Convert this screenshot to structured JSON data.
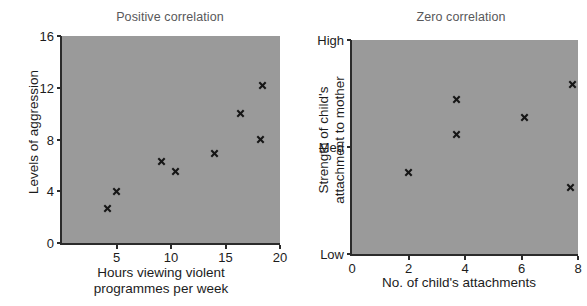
{
  "figure": {
    "background_color": "#ffffff",
    "plot_background_color": "#9a9a9a",
    "axis_color": "#2b2b2b",
    "title_color": "#58585a",
    "marker_color": "#161616",
    "marker_symbol": "x"
  },
  "chart_data": [
    {
      "type": "scatter",
      "title": "Positive correlation",
      "xlabel": "Hours viewing violent\nprogrammes per week",
      "ylabel": "Levels of aggression",
      "xlim": [
        0,
        20
      ],
      "ylim": [
        0,
        16
      ],
      "xticks": [
        5,
        10,
        15,
        20
      ],
      "xtick_labels": [
        "5",
        "10",
        "15",
        "20"
      ],
      "yticks": [
        0,
        4,
        8,
        12,
        16
      ],
      "ytick_labels": [
        "0",
        "4",
        "8",
        "12",
        "16"
      ],
      "grid": false,
      "legend": "none",
      "marker": "x",
      "points": [
        {
          "x": 4.2,
          "y": 2.7
        },
        {
          "x": 5.0,
          "y": 4.0
        },
        {
          "x": 9.1,
          "y": 6.3
        },
        {
          "x": 10.4,
          "y": 5.5
        },
        {
          "x": 14.0,
          "y": 6.9
        },
        {
          "x": 16.4,
          "y": 10.0
        },
        {
          "x": 18.2,
          "y": 8.0
        },
        {
          "x": 18.4,
          "y": 12.2
        }
      ]
    },
    {
      "type": "scatter",
      "title": "Zero correlation",
      "xlabel": "No. of child's attachments",
      "ylabel": "Strength of child's\nattachment to mother",
      "xlim": [
        0,
        8
      ],
      "ylim": [
        0,
        1
      ],
      "xticks": [
        0,
        2,
        4,
        6,
        8
      ],
      "xtick_labels": [
        "0",
        "2",
        "4",
        "6",
        "8"
      ],
      "yticks": [
        0,
        0.5,
        1
      ],
      "ytick_labels": [
        "Low",
        "Med",
        "High"
      ],
      "grid": false,
      "legend": "none",
      "marker": "x",
      "points": [
        {
          "x": 2.0,
          "y": 0.38
        },
        {
          "x": 3.7,
          "y": 0.72
        },
        {
          "x": 3.7,
          "y": 0.56
        },
        {
          "x": 6.1,
          "y": 0.64
        },
        {
          "x": 7.8,
          "y": 0.79
        },
        {
          "x": 7.75,
          "y": 0.31
        }
      ]
    }
  ]
}
